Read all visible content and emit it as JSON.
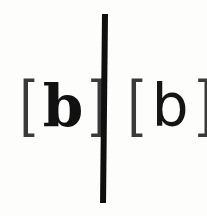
{
  "left_sample": {
    "open_bracket": "[",
    "letter": "b",
    "close_bracket": "]",
    "style": "bold serif"
  },
  "right_sample": {
    "open_bracket": "[",
    "letter": "b",
    "close_bracket": "]",
    "style": "light sans-serif"
  },
  "colors": {
    "ink": "#111111",
    "paper": "#fdfdfc"
  }
}
